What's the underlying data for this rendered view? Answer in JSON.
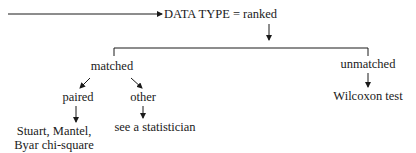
{
  "diagram": {
    "root": {
      "label": "DATA TYPE = ranked"
    },
    "branches": {
      "matched": {
        "label": "matched",
        "children": {
          "paired": {
            "label": "paired",
            "result_lines": [
              "Stuart, Mantel,",
              "Byar chi-square"
            ]
          },
          "other": {
            "label": "other",
            "result": "see a statistician"
          }
        }
      },
      "unmatched": {
        "label": "unmatched",
        "result": "Wilcoxon test"
      }
    }
  }
}
